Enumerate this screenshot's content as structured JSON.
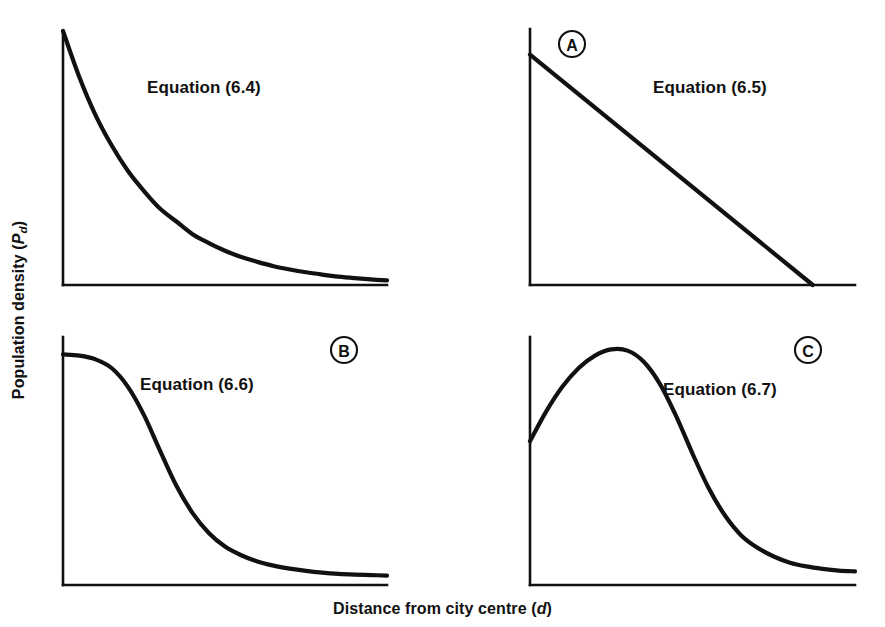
{
  "figure": {
    "background_color": "#ffffff",
    "ink_color": "#111111",
    "axis_titles": {
      "y_main": "Population density",
      "y_symbol": "P",
      "y_symbol_sub": "d",
      "y_full": "Population density (Pd)",
      "x_main": "Distance from city centre",
      "x_symbol": "d",
      "x_full": "Distance from city centre (d)"
    }
  },
  "panels": [
    {
      "id": "panel-equation-6-4",
      "badge": null,
      "label": "Equation (6.4)",
      "curve_name": "negative-exponential-decay"
    },
    {
      "id": "panel-equation-6-5",
      "badge": "A",
      "label": "Equation (6.5)",
      "curve_name": "linear-decline"
    },
    {
      "id": "panel-equation-6-6",
      "badge": "B",
      "label": "Equation (6.6)",
      "curve_name": "logistic-sigmoid-decay"
    },
    {
      "id": "panel-equation-6-7",
      "badge": "C",
      "label": "Equation (6.7)",
      "curve_name": "density-crater-peak-then-decay"
    }
  ],
  "chart_data": [
    {
      "type": "line",
      "title": "Equation (6.4)",
      "panel": "top-left",
      "annotation": "Equation (6.4)",
      "badge": null,
      "xlabel": "Distance from city centre (d)",
      "ylabel": "Population density (Pd)",
      "grid": false,
      "legend": "none",
      "axis_ticks": false,
      "xlim": [
        0,
        1
      ],
      "ylim": [
        0,
        1
      ],
      "x": [
        0.0,
        0.05,
        0.1,
        0.15,
        0.2,
        0.25,
        0.3,
        0.35,
        0.4,
        0.45,
        0.5,
        0.55,
        0.6,
        0.65,
        0.7,
        0.75,
        0.8,
        0.85,
        0.9,
        0.95,
        1.0
      ],
      "values": [
        1.0,
        0.82,
        0.67,
        0.55,
        0.45,
        0.37,
        0.3,
        0.25,
        0.2,
        0.165,
        0.135,
        0.11,
        0.091,
        0.074,
        0.061,
        0.05,
        0.041,
        0.033,
        0.027,
        0.022,
        0.018
      ]
    },
    {
      "type": "line",
      "title": "Equation (6.5)",
      "panel": "top-right",
      "annotation": "Equation (6.5)",
      "badge": "A",
      "xlabel": "Distance from city centre (d)",
      "ylabel": "Population density (Pd)",
      "grid": false,
      "legend": "none",
      "axis_ticks": false,
      "xlim": [
        0,
        1
      ],
      "ylim": [
        0,
        1
      ],
      "x": [
        0.0,
        0.1,
        0.2,
        0.3,
        0.4,
        0.5,
        0.6,
        0.7,
        0.8,
        0.87
      ],
      "values": [
        0.9,
        0.797,
        0.693,
        0.59,
        0.486,
        0.383,
        0.279,
        0.176,
        0.072,
        0.0
      ]
    },
    {
      "type": "line",
      "title": "Equation (6.6)",
      "panel": "bottom-left",
      "annotation": "Equation (6.6)",
      "badge": "B",
      "xlabel": "Distance from city centre (d)",
      "ylabel": "Population density (Pd)",
      "grid": false,
      "legend": "none",
      "axis_ticks": false,
      "xlim": [
        0,
        1
      ],
      "ylim": [
        0,
        1
      ],
      "x": [
        0.0,
        0.05,
        0.1,
        0.15,
        0.2,
        0.25,
        0.3,
        0.35,
        0.4,
        0.45,
        0.5,
        0.55,
        0.6,
        0.65,
        0.7,
        0.75,
        0.8,
        0.85,
        0.9,
        0.95,
        1.0
      ],
      "values": [
        0.93,
        0.925,
        0.91,
        0.875,
        0.8,
        0.685,
        0.54,
        0.4,
        0.29,
        0.21,
        0.155,
        0.12,
        0.095,
        0.078,
        0.066,
        0.057,
        0.05,
        0.045,
        0.042,
        0.04,
        0.038
      ]
    },
    {
      "type": "line",
      "title": "Equation (6.7)",
      "panel": "bottom-right",
      "annotation": "Equation (6.7)",
      "badge": "C",
      "xlabel": "Distance from city centre (d)",
      "ylabel": "Population density (Pd)",
      "grid": false,
      "legend": "none",
      "axis_ticks": false,
      "xlim": [
        0,
        1
      ],
      "ylim": [
        0,
        1
      ],
      "x": [
        0.0,
        0.05,
        0.1,
        0.15,
        0.2,
        0.25,
        0.3,
        0.35,
        0.4,
        0.45,
        0.5,
        0.55,
        0.6,
        0.65,
        0.7,
        0.75,
        0.8,
        0.85,
        0.9,
        0.95,
        1.0
      ],
      "values": [
        0.58,
        0.7,
        0.8,
        0.875,
        0.925,
        0.95,
        0.945,
        0.9,
        0.81,
        0.68,
        0.53,
        0.39,
        0.28,
        0.2,
        0.15,
        0.115,
        0.09,
        0.075,
        0.065,
        0.058,
        0.055
      ]
    }
  ]
}
